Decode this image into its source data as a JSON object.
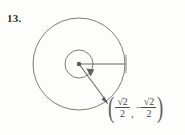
{
  "figure": {
    "problem_number": "13.",
    "type": "unit-circle-angle-diagram",
    "canvas": {
      "width": 185,
      "height": 135,
      "background": "#fdfdfc"
    },
    "ink_color": "#5a5a5a",
    "text_color": "#3a3a3a",
    "circle": {
      "cx": 79,
      "cy": 64,
      "r": 46,
      "label": "unit-circle"
    },
    "arc_circle": {
      "cx": 79,
      "cy": 64,
      "r": 14,
      "label": "angle-arc"
    },
    "center_point": {
      "cx": 79,
      "cy": 64,
      "r": 2.1,
      "label": "origin"
    },
    "initial_ray": {
      "x1": 79,
      "y1": 64,
      "x2": 126,
      "y2": 64,
      "label": "initial-side"
    },
    "initial_ray_tick": {
      "x": 126,
      "y1": 56,
      "y2": 72
    },
    "terminal_ray": {
      "x1": 79,
      "y1": 64,
      "x2": 108,
      "y2": 104,
      "label": "terminal-side"
    },
    "terminal_arrow_tip": {
      "x": 108,
      "y": 104
    },
    "arc_arrow_tip": {
      "x": 90.5,
      "y": 74
    },
    "rotation": "clockwise"
  },
  "coordinate_label": {
    "open_paren": "(",
    "close_paren": ")",
    "comma": ",",
    "minus_sign": "−",
    "x_value": {
      "numerator": "√2",
      "denominator": "2",
      "sign": ""
    },
    "y_value": {
      "numerator": "√2",
      "denominator": "2",
      "sign": "−"
    },
    "full_text": "(√2/2, −√2/2)"
  }
}
